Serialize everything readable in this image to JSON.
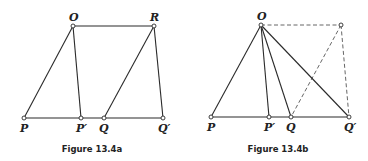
{
  "figures": [
    {
      "id": "a",
      "caption": "Figure 13.4a",
      "points": {
        "O": {
          "label": "O",
          "x": 73,
          "y": 26
        },
        "R": {
          "label": "R",
          "x": 154,
          "y": 26
        },
        "P": {
          "label": "P",
          "x": 24,
          "y": 118
        },
        "P_prime": {
          "label": "P′",
          "x": 81,
          "y": 118
        },
        "Q": {
          "label": "Q",
          "x": 104,
          "y": 118
        },
        "Q_prime": {
          "label": "Q′",
          "x": 163,
          "y": 118
        }
      },
      "segments": [
        {
          "from": "O",
          "to": "R",
          "style": "solid"
        },
        {
          "from": "P",
          "to": "Q_prime",
          "style": "solid"
        },
        {
          "from": "O",
          "to": "P",
          "style": "solid"
        },
        {
          "from": "O",
          "to": "P_prime",
          "style": "solid"
        },
        {
          "from": "R",
          "to": "Q",
          "style": "solid"
        },
        {
          "from": "R",
          "to": "Q_prime",
          "style": "solid"
        }
      ]
    },
    {
      "id": "b",
      "caption": "Figure 13.4b",
      "points": {
        "O": {
          "label": "O",
          "x": 261,
          "y": 25
        },
        "R": {
          "label": "",
          "x": 341,
          "y": 25
        },
        "P": {
          "label": "P",
          "x": 211,
          "y": 117
        },
        "P_prime": {
          "label": "P′",
          "x": 269,
          "y": 117
        },
        "Q": {
          "label": "Q",
          "x": 291,
          "y": 117
        },
        "Q_prime": {
          "label": "Q′",
          "x": 349,
          "y": 117
        }
      },
      "segments": [
        {
          "from": "O",
          "to": "R",
          "style": "dashed"
        },
        {
          "from": "R",
          "to": "Q",
          "style": "dashed"
        },
        {
          "from": "R",
          "to": "Q_prime",
          "style": "dashed"
        },
        {
          "from": "P",
          "to": "Q_prime",
          "style": "solid"
        },
        {
          "from": "O",
          "to": "P",
          "style": "solid"
        },
        {
          "from": "O",
          "to": "P_prime",
          "style": "solid"
        },
        {
          "from": "O",
          "to": "Q",
          "style": "solid"
        },
        {
          "from": "O",
          "to": "Q_prime",
          "style": "solid"
        }
      ]
    }
  ]
}
